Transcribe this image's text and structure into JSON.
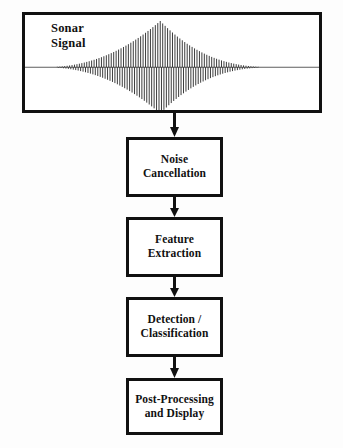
{
  "diagram": {
    "type": "flowchart",
    "orientation": "vertical",
    "colors": {
      "stroke": "#111111",
      "background": "#ffffff",
      "waveform": "#1a1a1a"
    },
    "signal_panel": {
      "label": "Sonar\nSignal",
      "waveform": {
        "kind": "amplitude-modulated-tone-burst",
        "envelope": "lens",
        "cycles": 96,
        "baseline_y": 0.55,
        "peak_center_x": 0.46,
        "rise_start_x": 0.06,
        "decay_end_x": 0.86
      }
    },
    "stages": [
      {
        "id": "noise-cancellation",
        "label": "Noise\nCancellation"
      },
      {
        "id": "feature-extraction",
        "label": "Feature\nExtraction"
      },
      {
        "id": "detection-classification",
        "label": "Detection /\nClassification"
      },
      {
        "id": "post-processing-display",
        "label": "Post-Processing\nand Display"
      }
    ],
    "arrows": [
      {
        "id": "arrow-signal-to-noise",
        "direction": "down"
      },
      {
        "id": "arrow-noise-to-feature",
        "direction": "down"
      },
      {
        "id": "arrow-feature-to-detection",
        "direction": "down"
      },
      {
        "id": "arrow-detection-to-post",
        "direction": "down"
      }
    ]
  }
}
